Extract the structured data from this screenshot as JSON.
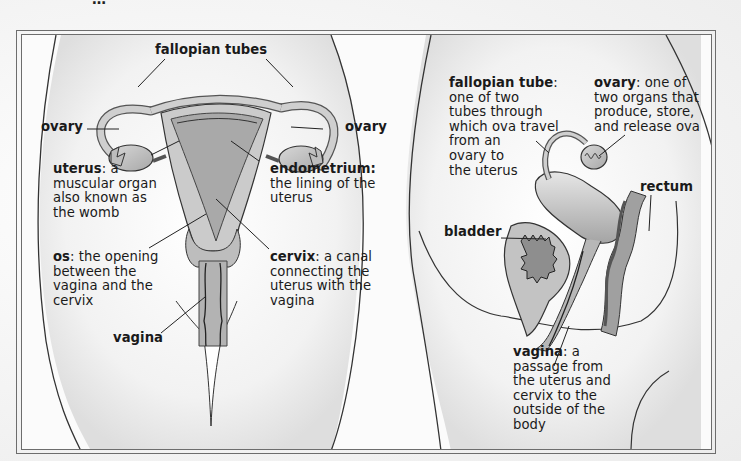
{
  "figure": {
    "title_cutoff": "…",
    "left_panel": {
      "view": "front view",
      "labels": {
        "fallopian_tubes": "fallopian tubes",
        "ovary_left": "ovary",
        "ovary_right": "ovary",
        "uterus_term": "uterus",
        "uterus_def": ": a\nmuscular organ\nalso known as\nthe womb",
        "endometrium_term": "endometrium:",
        "endometrium_def": "the lining of the\nuterus",
        "os_term": "os",
        "os_def": ": the opening\nbetween the\nvagina and the\ncervix",
        "cervix_term": "cervix",
        "cervix_def": ": a canal\nconnecting the\nuterus with the\nvagina",
        "vagina": "vagina"
      }
    },
    "right_panel": {
      "view": "side view",
      "labels": {
        "fallopian_tube_term": "fallopian tube",
        "fallopian_tube_def": ":\none of two\ntubes through\nwhich ova travel\nfrom an\novary to\nthe uterus",
        "ovary_term": "ovary",
        "ovary_def": ": one of\ntwo organs that\nproduce, store,\nand release ova",
        "rectum": "rectum",
        "bladder": "bladder",
        "vagina_term": "vagina",
        "vagina_def": ": a\npassage from\nthe uterus and\ncervix to the\noutside of the\nbody"
      }
    },
    "colors": {
      "organ_fill": "#c9c9c9",
      "organ_dark": "#9a9a9a",
      "outline": "#2a2a2a",
      "frame": "#6d6d6d",
      "background": "#fbfbfb"
    }
  }
}
